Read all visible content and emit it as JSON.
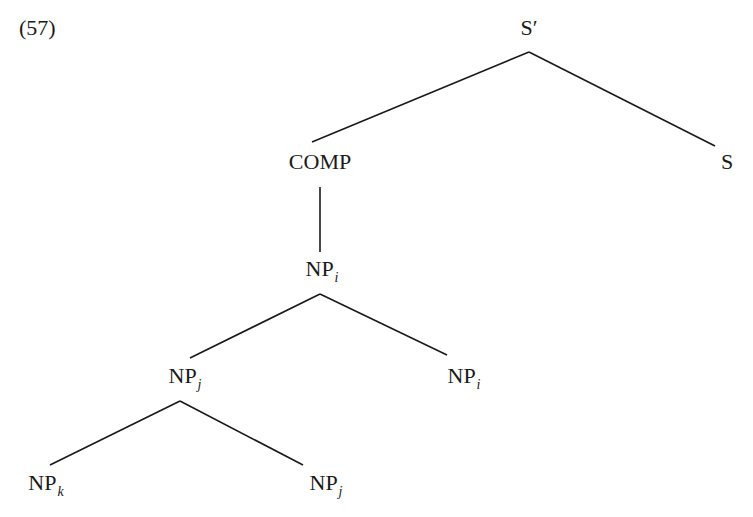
{
  "example": {
    "number": "(57)"
  },
  "tree": {
    "nodes": {
      "s_bar": {
        "label": "S′",
        "sub": ""
      },
      "comp": {
        "label": "COMP",
        "sub": ""
      },
      "s": {
        "label": "S",
        "sub": ""
      },
      "np_i_top": {
        "label": "NP",
        "sub": "i"
      },
      "np_j_mid": {
        "label": "NP",
        "sub": "j"
      },
      "np_i_right": {
        "label": "NP",
        "sub": "i"
      },
      "np_k": {
        "label": "NP",
        "sub": "k"
      },
      "np_j_bottom": {
        "label": "NP",
        "sub": "j"
      }
    },
    "edges": [
      {
        "from": "S′",
        "to": "COMP"
      },
      {
        "from": "S′",
        "to": "S"
      },
      {
        "from": "COMP",
        "to": "NP_i"
      },
      {
        "from": "NP_i",
        "to": "NP_j"
      },
      {
        "from": "NP_i",
        "to": "NP_i"
      },
      {
        "from": "NP_j",
        "to": "NP_k"
      },
      {
        "from": "NP_j",
        "to": "NP_j"
      }
    ],
    "line_color": "#1a1a1a"
  }
}
